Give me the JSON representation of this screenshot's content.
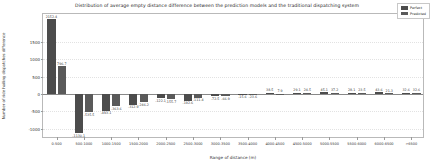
{
  "chart_data": {
    "type": "bar",
    "title": "Distribution of average empty distance difference between the prediction models and the traditional dispatching system",
    "xlabel": "Range of distance (m)",
    "ylabel": "Number of ride hailing dispatches difference",
    "categories": [
      "0-500",
      "500-1000",
      "1000-1500",
      "1500-2000",
      "2000-2500",
      "2500-3000",
      "3000-3500",
      "3500-4000",
      "4000-4500",
      "4500-5000",
      "5000-5500",
      "5500-6000",
      "6000-6500",
      ">6500"
    ],
    "series": [
      {
        "name": "Perfect",
        "color": "#4c4c4c",
        "values": [
          2152.4,
          -1130.1,
          -493.1,
          -312.9,
          -122.1,
          -192.6,
          -72.5,
          -15.6,
          38.5,
          29.1,
          45.1,
          28.1,
          43.6,
          32.6
        ]
      },
      {
        "name": "Predicted",
        "color": "#5a5a5a",
        "values": [
          796.7,
          -535.5,
          -363.6,
          -246.2,
          -155.7,
          -111.4,
          -66.9,
          -23.6,
          7.9,
          24.5,
          37.2,
          23.5,
          21.3,
          32.6
        ]
      }
    ],
    "ylim": [
      -1300,
      2300
    ],
    "yticks": [
      1500,
      1000,
      500,
      0,
      -500,
      -1000
    ],
    "ytick_labels": [
      "1500",
      "1000",
      "500",
      "0",
      "-500",
      "-1000"
    ],
    "grid": false,
    "legend_position": "upper right",
    "value_labels": {
      "perfect": [
        "2152.4",
        "-1130.1",
        "-493.1",
        "-312.9",
        "-122.1",
        "-192.6",
        "-72.5",
        "-15.6",
        "38.5",
        "29.1",
        "45.1",
        "28.1",
        "43.6",
        "32.6"
      ],
      "predicted": [
        "796.7",
        "-535.5",
        "-363.6",
        "-246.2",
        "-155.7",
        "-111.4",
        "-66.9",
        "-23.6",
        "7.9",
        "24.5",
        "37.2",
        "23.5",
        "21.3",
        "32.6"
      ]
    }
  }
}
